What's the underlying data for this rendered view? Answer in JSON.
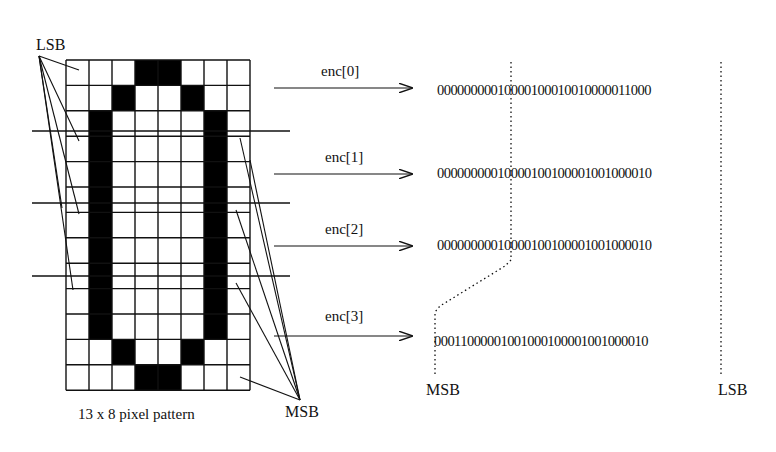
{
  "figure": {
    "pixel_pattern": {
      "caption": "13 x 8 pixel pattern",
      "rows": 13,
      "cols": 8,
      "grid": [
        "00011000",
        "00100100",
        "01000010",
        "01000010",
        "01000010",
        "01000010",
        "01000010",
        "01000010",
        "01000010",
        "01000010",
        "01000010",
        "00100100",
        "00011000"
      ],
      "left_label": "LSB",
      "right_label": "MSB"
    },
    "encodings": [
      {
        "label": "enc[0]",
        "bits": "00000000010000100010010000011000"
      },
      {
        "label": "enc[1]",
        "bits": "00000000010000100100001001000010"
      },
      {
        "label": "enc[2]",
        "bits": "00000000010000100100001001000010"
      },
      {
        "label": "enc[3]",
        "bits": "00011000001001000100001001000010"
      }
    ],
    "bit_axis": {
      "msb_label": "MSB",
      "lsb_label": "LSB"
    },
    "colors": {
      "ink": "#111111",
      "pixel_on": "#000000",
      "pixel_off": "#ffffff"
    }
  }
}
